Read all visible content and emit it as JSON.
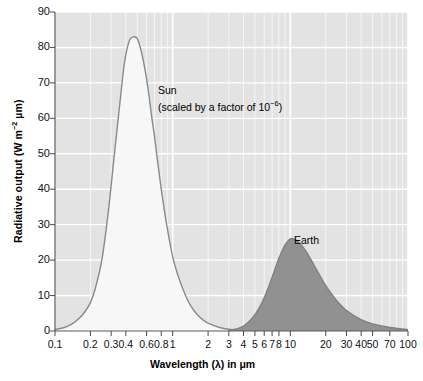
{
  "chart_data": {
    "type": "area",
    "title": "",
    "xlabel": "Wavelength (λ) in μm",
    "ylabel": "Radiative output (W m⁻² μm)",
    "xscale": "log",
    "yscale": "linear",
    "xlim": [
      0.1,
      100
    ],
    "ylim": [
      0,
      90
    ],
    "grid": true,
    "legend_position": "inline-annotations",
    "background_color": "#e3e3e3",
    "gridline_color": "#ffffff",
    "xticks": [
      0.1,
      0.2,
      0.3,
      0.4,
      0.6,
      0.8,
      1,
      2,
      3,
      4,
      5,
      6,
      7,
      8,
      10,
      20,
      30,
      40,
      50,
      70,
      100
    ],
    "xtick_labels": [
      "0.1",
      "0.2",
      "0.3",
      "0.4",
      "0.6",
      "0.8",
      "1",
      "2",
      "3",
      "4",
      "5",
      "6",
      "7",
      "8",
      "10",
      "20",
      "30",
      "40",
      "50",
      "70",
      "100"
    ],
    "yticks": [
      0,
      10,
      20,
      30,
      40,
      50,
      60,
      70,
      80,
      90
    ],
    "ytick_labels": [
      "0",
      "10",
      "20",
      "30",
      "40",
      "50",
      "60",
      "70",
      "80",
      "90"
    ],
    "series": [
      {
        "name": "Sun",
        "fill_color": "#f7f7f7",
        "line_color": "#8a8a8a",
        "peak_x": 0.5,
        "peak_y": 83,
        "x": [
          0.1,
          0.12,
          0.14,
          0.16,
          0.18,
          0.2,
          0.22,
          0.25,
          0.28,
          0.3,
          0.32,
          0.35,
          0.38,
          0.4,
          0.43,
          0.46,
          0.5,
          0.54,
          0.58,
          0.62,
          0.66,
          0.7,
          0.75,
          0.8,
          0.85,
          0.9,
          1.0,
          1.1,
          1.25,
          1.4,
          1.6,
          1.8,
          2.0,
          2.5,
          3.0,
          4.0
        ],
        "y": [
          0.4,
          1.0,
          2.0,
          3.5,
          5.5,
          8.0,
          12.0,
          20.0,
          32.0,
          41.0,
          50.0,
          62.0,
          73.0,
          78.0,
          82.0,
          83.0,
          82.5,
          79.0,
          74.0,
          68.0,
          61.0,
          55.0,
          47.0,
          40.0,
          34.0,
          29.0,
          21.0,
          16.0,
          11.0,
          7.5,
          4.8,
          3.2,
          2.2,
          1.0,
          0.5,
          0.2
        ]
      },
      {
        "name": "Earth",
        "fill_color": "#919191",
        "line_color": "#818181",
        "peak_x": 10,
        "peak_y": 26,
        "x": [
          3.0,
          3.5,
          4.0,
          4.5,
          5.0,
          5.5,
          6.0,
          6.5,
          7.0,
          7.5,
          8.0,
          9.0,
          10.0,
          11.0,
          12.0,
          13.0,
          14.0,
          16.0,
          18.0,
          20.0,
          25.0,
          30.0,
          40.0,
          50.0,
          70.0,
          100.0
        ],
        "y": [
          0.2,
          0.6,
          1.4,
          2.8,
          4.6,
          6.8,
          9.4,
          12.2,
          15.2,
          18.0,
          20.5,
          24.2,
          26.0,
          25.8,
          24.8,
          23.4,
          21.8,
          18.4,
          15.4,
          12.8,
          8.4,
          5.8,
          3.2,
          2.0,
          1.0,
          0.4
        ]
      }
    ],
    "annotations": [
      {
        "name": "sun-label",
        "line1": "Sun",
        "line2_prefix": "(scaled by a factor of 10",
        "line2_sup": "−6",
        "line2_suffix": ")",
        "x_px": 158,
        "y_px": 84
      },
      {
        "name": "earth-label",
        "text": "Earth",
        "x_px": 294,
        "y_px": 234
      }
    ]
  }
}
